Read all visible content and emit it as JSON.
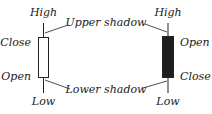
{
  "diagram": {
    "title": "",
    "colors": {
      "ink": "#222222",
      "bullish_body": "#ffffff",
      "bearish_body": "#1e1e1e",
      "background": "#ffffff"
    },
    "candles": [
      {
        "id": "bullish",
        "type": "white",
        "high_label": "High",
        "top_label": "Close",
        "bottom_label": "Open",
        "low_label": "Low"
      },
      {
        "id": "bearish",
        "type": "black",
        "high_label": "High",
        "top_label": "Open",
        "bottom_label": "Close",
        "low_label": "Low"
      }
    ],
    "annotations": {
      "upper": "Upper shadow",
      "lower": "Lower shadow"
    }
  }
}
